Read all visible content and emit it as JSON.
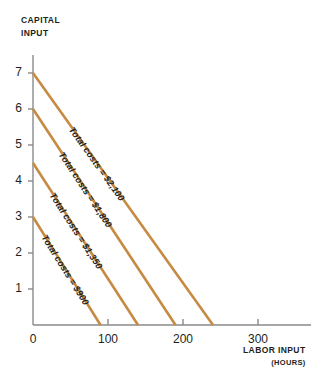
{
  "chart_data": {
    "type": "line",
    "title": "",
    "xlabel": "LABOR INPUT",
    "xlabel_sub": "(HOURS)",
    "ylabel_line1": "CAPITAL",
    "ylabel_line2": "INPUT",
    "xlim": [
      0,
      370
    ],
    "ylim": [
      0,
      7.6
    ],
    "grid": false,
    "legend": "inline-labels",
    "xticks": [
      0,
      100,
      200,
      300
    ],
    "xtick_labels": [
      "0",
      "100",
      "200",
      "300"
    ],
    "yticks": [
      1,
      2,
      3,
      4,
      5,
      6,
      7
    ],
    "ytick_labels": [
      "1",
      "2",
      "3",
      "4",
      "5",
      "6",
      "7"
    ],
    "line_color": "#C68A42",
    "axis_color": "#8a8a8a",
    "text_color": "#231f20",
    "series": [
      {
        "name": "Total costs = $900",
        "label": "Total costs = $900",
        "x": [
          0,
          90
        ],
        "y": [
          3,
          0
        ],
        "y_intercept": 3,
        "x_intercept": 90
      },
      {
        "name": "Total costs = $1,350",
        "label": "Total costs = $1,350",
        "x": [
          0,
          140
        ],
        "y": [
          4.5,
          0
        ],
        "y_intercept": 4.5,
        "x_intercept": 140
      },
      {
        "name": "Total costs = $1,800",
        "label": "Total costs = $1,800",
        "x": [
          0,
          190
        ],
        "y": [
          6,
          0
        ],
        "y_intercept": 6,
        "x_intercept": 190
      },
      {
        "name": "Total costs = $2,100",
        "label": "Total costs = $2,100",
        "x": [
          0,
          240
        ],
        "y": [
          7,
          0
        ],
        "y_intercept": 7,
        "x_intercept": 240
      }
    ]
  }
}
